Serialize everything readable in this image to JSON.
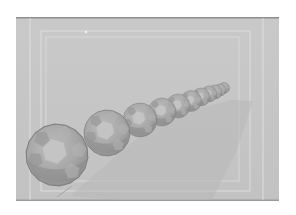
{
  "scene": {
    "description": "3D rendering of a chain of faceted polyhedral spheres receding in perspective over a gray ground plane with guide frames",
    "colors": {
      "page_background": "#ffffff",
      "panel": "#c6c6c6",
      "panel_border_top": "#8e8e8e",
      "panel_border_bottom": "#9a9a9a",
      "guide_lines": "#e2e2e2",
      "shadow": "#b9b9b9",
      "sphere_base": "#a9a9a9",
      "sphere_light_face": "#c4c4c4",
      "sphere_dark_face": "#8a8a8a",
      "sphere_edge": "#7c7c7c"
    },
    "panel": {
      "x": 16,
      "y": 17,
      "width": 263,
      "height": 184
    },
    "spheres": [
      {
        "cx": 57,
        "cy": 155,
        "r": 31
      },
      {
        "cx": 107,
        "cy": 133,
        "r": 23
      },
      {
        "cx": 140,
        "cy": 120,
        "r": 17
      },
      {
        "cx": 162,
        "cy": 112,
        "r": 14
      },
      {
        "cx": 178,
        "cy": 106,
        "r": 12
      },
      {
        "cx": 191,
        "cy": 101,
        "r": 10.5
      },
      {
        "cx": 201,
        "cy": 97,
        "r": 9
      },
      {
        "cx": 209,
        "cy": 94,
        "r": 8
      },
      {
        "cx": 215,
        "cy": 92,
        "r": 7
      },
      {
        "cx": 220,
        "cy": 90,
        "r": 6
      },
      {
        "cx": 224,
        "cy": 88,
        "r": 5.5
      }
    ]
  }
}
